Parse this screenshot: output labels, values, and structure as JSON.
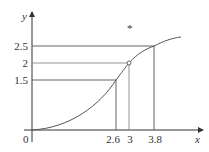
{
  "figure": {
    "axes": {
      "x_label": "x",
      "y_label": "y",
      "origin_label": "0"
    },
    "y_ticks": [
      {
        "label": "2.5",
        "value": 2.5
      },
      {
        "label": "2",
        "value": 2
      },
      {
        "label": "1.5",
        "value": 1.5
      }
    ],
    "x_ticks": [
      {
        "label": "2.6",
        "value": 2.6
      },
      {
        "label": "3",
        "value": 3
      },
      {
        "label": "3.8",
        "value": 3.8
      }
    ],
    "marker": "*",
    "colors": {
      "axis": "#333333",
      "curve": "#555555",
      "guide_lines": "#555555"
    }
  }
}
